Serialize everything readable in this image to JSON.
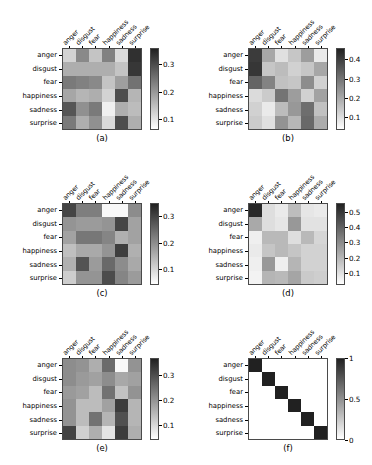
{
  "figure": {
    "rows": [
      "anger",
      "disgust",
      "fear",
      "happiness",
      "sadness",
      "surprise"
    ],
    "cols": [
      "anger",
      "disgust",
      "fear",
      "happiness",
      "sadness",
      "surprise"
    ],
    "cmap": "gray-reversed",
    "background": "#ffffff"
  },
  "chart_data": [
    {
      "type": "heatmap",
      "panel": "a",
      "caption": "(a)",
      "title": "",
      "xlabel": "",
      "ylabel": "",
      "xticklabels": [
        "anger",
        "disgust",
        "fear",
        "happiness",
        "sadness",
        "surprise"
      ],
      "yticklabels": [
        "anger",
        "disgust",
        "fear",
        "happiness",
        "sadness",
        "surprise"
      ],
      "colorbar": {
        "ticks": [
          0.1,
          0.2,
          0.3
        ],
        "ticklabels": [
          "0.1",
          "0.2",
          "0.3"
        ],
        "vmin": 0.06,
        "vmax": 0.36,
        "position": "right",
        "orientation": "vertical"
      },
      "grid": false,
      "values": [
        [
          0.12,
          0.22,
          0.14,
          0.23,
          0.11,
          0.34
        ],
        [
          0.17,
          0.17,
          0.17,
          0.17,
          0.14,
          0.33
        ],
        [
          0.24,
          0.23,
          0.22,
          0.14,
          0.19,
          0.25
        ],
        [
          0.18,
          0.16,
          0.17,
          0.12,
          0.3,
          0.16
        ],
        [
          0.29,
          0.21,
          0.24,
          0.08,
          0.17,
          0.15
        ],
        [
          0.24,
          0.17,
          0.21,
          0.11,
          0.3,
          0.17
        ]
      ]
    },
    {
      "type": "heatmap",
      "panel": "b",
      "caption": "(b)",
      "title": "",
      "xlabel": "",
      "ylabel": "",
      "xticklabels": [
        "anger",
        "disgust",
        "fear",
        "happiness",
        "sadness",
        "surprise"
      ],
      "yticklabels": [
        "anger",
        "disgust",
        "fear",
        "happiness",
        "sadness",
        "surprise"
      ],
      "colorbar": {
        "ticks": [
          0.1,
          0.2,
          0.3,
          0.4
        ],
        "ticklabels": [
          "0.1",
          "0.2",
          "0.3",
          "0.4"
        ],
        "vmin": 0.03,
        "vmax": 0.46,
        "position": "right",
        "orientation": "vertical"
      },
      "grid": false,
      "values": [
        [
          0.41,
          0.2,
          0.09,
          0.14,
          0.22,
          0.07
        ],
        [
          0.42,
          0.14,
          0.16,
          0.12,
          0.14,
          0.2
        ],
        [
          0.33,
          0.27,
          0.15,
          0.14,
          0.25,
          0.12
        ],
        [
          0.1,
          0.13,
          0.3,
          0.22,
          0.12,
          0.21
        ],
        [
          0.12,
          0.07,
          0.16,
          0.23,
          0.31,
          0.15
        ],
        [
          0.13,
          0.09,
          0.24,
          0.17,
          0.32,
          0.19
        ]
      ]
    },
    {
      "type": "heatmap",
      "panel": "c",
      "caption": "(c)",
      "title": "",
      "xlabel": "",
      "ylabel": "",
      "xticklabels": [
        "anger",
        "disgust",
        "fear",
        "happiness",
        "sadness",
        "surprise"
      ],
      "yticklabels": [
        "anger",
        "disgust",
        "fear",
        "happiness",
        "sadness",
        "surprise"
      ],
      "colorbar": {
        "ticks": [
          0.1,
          0.2,
          0.3
        ],
        "ticklabels": [
          "0.1",
          "0.2",
          "0.3"
        ],
        "vmin": 0.04,
        "vmax": 0.35,
        "position": "right",
        "orientation": "vertical"
      },
      "grid": false,
      "values": [
        [
          0.3,
          0.22,
          0.22,
          0.05,
          0.05,
          0.2
        ],
        [
          0.19,
          0.18,
          0.18,
          0.19,
          0.3,
          0.17
        ],
        [
          0.17,
          0.23,
          0.23,
          0.21,
          0.15,
          0.17
        ],
        [
          0.13,
          0.16,
          0.16,
          0.19,
          0.31,
          0.15
        ],
        [
          0.15,
          0.28,
          0.18,
          0.25,
          0.2,
          0.16
        ],
        [
          0.11,
          0.19,
          0.19,
          0.29,
          0.21,
          0.18
        ]
      ]
    },
    {
      "type": "heatmap",
      "panel": "d",
      "caption": "(d)",
      "title": "",
      "xlabel": "",
      "ylabel": "",
      "xticklabels": [
        "anger",
        "disgust",
        "fear",
        "happiness",
        "sadness",
        "surprise"
      ],
      "yticklabels": [
        "anger",
        "disgust",
        "fear",
        "happiness",
        "sadness",
        "surprise"
      ],
      "colorbar": {
        "ticks": [
          0.1,
          0.2,
          0.3,
          0.4,
          0.5
        ],
        "ticklabels": [
          "0.1",
          "0.2",
          "0.3",
          "0.4",
          "0.5"
        ],
        "vmin": 0.02,
        "vmax": 0.56,
        "position": "right",
        "orientation": "vertical"
      },
      "grid": false,
      "values": [
        [
          0.54,
          0.1,
          0.07,
          0.18,
          0.08,
          0.07
        ],
        [
          0.23,
          0.1,
          0.08,
          0.27,
          0.09,
          0.09
        ],
        [
          0.06,
          0.19,
          0.19,
          0.1,
          0.19,
          0.12
        ],
        [
          0.07,
          0.16,
          0.19,
          0.16,
          0.13,
          0.13
        ],
        [
          0.06,
          0.27,
          0.06,
          0.2,
          0.13,
          0.13
        ],
        [
          0.05,
          0.2,
          0.19,
          0.24,
          0.15,
          0.14
        ]
      ]
    },
    {
      "type": "heatmap",
      "panel": "e",
      "caption": "(e)",
      "title": "",
      "xlabel": "",
      "ylabel": "",
      "xticklabels": [
        "anger",
        "disgust",
        "fear",
        "happiness",
        "sadness",
        "surprise"
      ],
      "yticklabels": [
        "anger",
        "disgust",
        "fear",
        "happiness",
        "sadness",
        "surprise"
      ],
      "colorbar": {
        "ticks": [
          0.1,
          0.2,
          0.3
        ],
        "ticklabels": [
          "0.1",
          "0.2",
          "0.3"
        ],
        "vmin": 0.04,
        "vmax": 0.37,
        "position": "right",
        "orientation": "vertical"
      },
      "grid": false,
      "values": [
        [
          0.21,
          0.2,
          0.16,
          0.26,
          0.05,
          0.2
        ],
        [
          0.21,
          0.19,
          0.18,
          0.21,
          0.17,
          0.18
        ],
        [
          0.19,
          0.18,
          0.14,
          0.25,
          0.13,
          0.2
        ],
        [
          0.2,
          0.14,
          0.14,
          0.18,
          0.33,
          0.15
        ],
        [
          0.2,
          0.14,
          0.25,
          0.15,
          0.3,
          0.15
        ],
        [
          0.32,
          0.11,
          0.16,
          0.08,
          0.33,
          0.16
        ]
      ]
    },
    {
      "type": "heatmap",
      "panel": "f",
      "caption": "(f)",
      "title": "",
      "xlabel": "",
      "ylabel": "",
      "xticklabels": [
        "anger",
        "disgust",
        "fear",
        "happiness",
        "sadness",
        "surprise"
      ],
      "yticklabels": [
        "anger",
        "disgust",
        "fear",
        "happiness",
        "sadness",
        "surprise"
      ],
      "colorbar": {
        "ticks": [
          0,
          0.5,
          1
        ],
        "ticklabels": [
          "0",
          "0.5",
          "1"
        ],
        "vmin": 0,
        "vmax": 1,
        "position": "right",
        "orientation": "vertical"
      },
      "grid": false,
      "values": [
        [
          1,
          0,
          0,
          0,
          0,
          0
        ],
        [
          0,
          1,
          0,
          0,
          0,
          0
        ],
        [
          0,
          0,
          1,
          0,
          0,
          0
        ],
        [
          0,
          0,
          0,
          1,
          0,
          0
        ],
        [
          0,
          0,
          0,
          0,
          1,
          0
        ],
        [
          0,
          0,
          0,
          0,
          0,
          1
        ]
      ]
    }
  ]
}
